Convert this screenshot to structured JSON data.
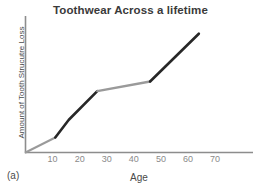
{
  "figure": {
    "caption": "(a)"
  },
  "chart_data": {
    "type": "line",
    "title": "Toothwear Across a lifetime",
    "xlabel": "Age",
    "ylabel": "Amount of Tooth Strucutre Loss",
    "xlim": [
      0,
      84
    ],
    "ylim": [
      0,
      100
    ],
    "xticks": [
      10,
      20,
      30,
      40,
      50,
      60,
      70
    ],
    "xtick_labels": [
      "10",
      "20",
      "30",
      "40",
      "50",
      "60",
      "70"
    ],
    "yticks": [],
    "ytick_labels": [],
    "grid": false,
    "legend": null,
    "x": [
      0,
      11,
      16,
      26.5,
      46,
      64
    ],
    "y": [
      0,
      11,
      24,
      45,
      52,
      87
    ],
    "series": [
      {
        "name": "Tooth structure loss",
        "x": [
          0,
          11,
          16,
          26.5,
          46,
          64
        ],
        "values": [
          0,
          11,
          24,
          45,
          52,
          87
        ]
      }
    ],
    "segments": [
      {
        "name": "childhood-slow-wear",
        "x": [
          0,
          11
        ],
        "y": [
          0,
          11
        ],
        "color": "#9a9a9a",
        "width": 2.0
      },
      {
        "name": "adolescent-rapid-wear",
        "x": [
          11,
          16,
          26.5
        ],
        "y": [
          11,
          24,
          45
        ],
        "color": "#272727",
        "width": 2.6
      },
      {
        "name": "adult-plateau-wear",
        "x": [
          26.5,
          46
        ],
        "y": [
          45,
          52
        ],
        "color": "#9a9a9a",
        "width": 2.4
      },
      {
        "name": "late-life-rapid-wear",
        "x": [
          46,
          64
        ],
        "y": [
          52,
          87
        ],
        "color": "#272727",
        "width": 2.6
      }
    ],
    "colors": {
      "axis": "#8d8d8d",
      "dark_segment": "#272727",
      "gray_segment": "#9a9a9a",
      "title": "#3a3a3a",
      "tick_label": "#8a8a8a",
      "axis_label": "#4a4a4a",
      "background": "#ffffff"
    }
  }
}
